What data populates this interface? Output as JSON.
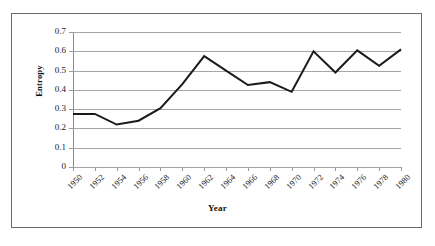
{
  "chart_data": {
    "type": "line",
    "title": "",
    "xlabel": "Year",
    "ylabel": "Entropy",
    "x": [
      1950,
      1952,
      1954,
      1956,
      1958,
      1960,
      1962,
      1964,
      1966,
      1968,
      1970,
      1972,
      1974,
      1976,
      1978,
      1980
    ],
    "categories": [
      "1950",
      "1952",
      "1954",
      "1956",
      "1958",
      "1960",
      "1962",
      "1964",
      "1966",
      "1968",
      "1970",
      "1972",
      "1974",
      "1976",
      "1978",
      "1980"
    ],
    "series": [
      {
        "name": "Entropy",
        "values": [
          0.275,
          0.275,
          0.22,
          0.24,
          0.305,
          0.43,
          0.575,
          0.5,
          0.425,
          0.44,
          0.39,
          0.6,
          0.49,
          0.605,
          0.525,
          0.61
        ],
        "color": "#1a1a1a"
      }
    ],
    "xlim": [
      1950,
      1980
    ],
    "ylim": [
      0,
      0.7
    ],
    "ytick_labels": [
      "0",
      "0.1",
      "0.2",
      "0.3",
      "0.4",
      "0.5",
      "0.6",
      "0.7"
    ],
    "ytick_values": [
      0,
      0.1,
      0.2,
      0.3,
      0.4,
      0.5,
      0.6,
      0.7
    ],
    "grid": "horizontal",
    "legend": "none",
    "gridline_color": "#a6a6a6",
    "axis_color": "#8a8a8a",
    "border_color": "#6b6b6b",
    "background": "#ffffff"
  }
}
